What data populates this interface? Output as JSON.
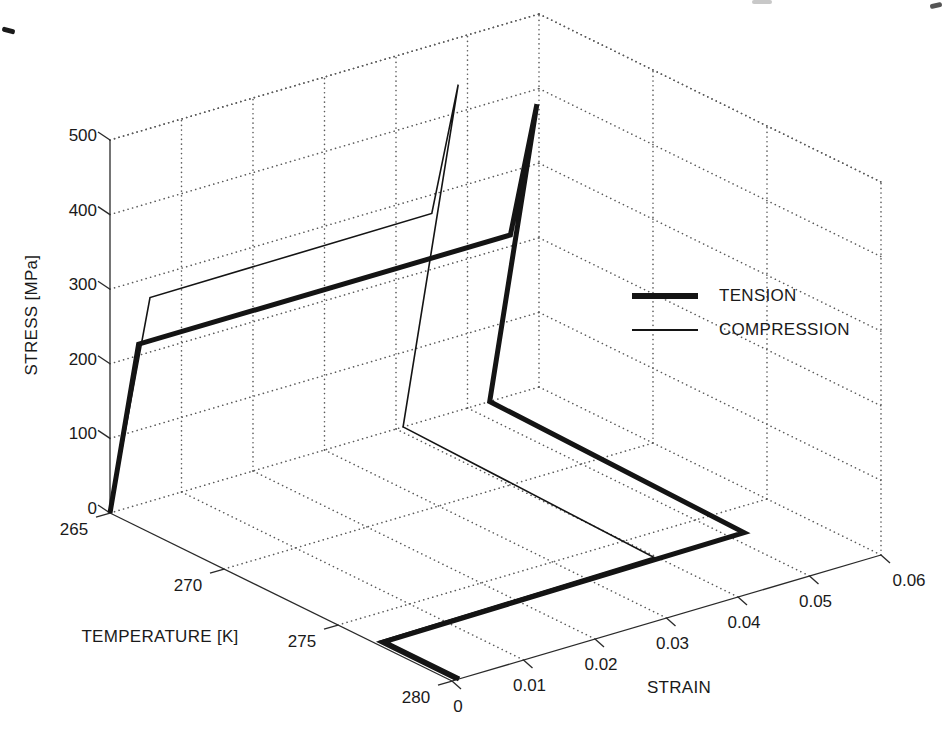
{
  "figure": {
    "background": "#ffffff",
    "curve_color": "#141414",
    "axis_color": "#2a2a2a",
    "grid_color": "#5a5a5a"
  },
  "legend": {
    "items": [
      {
        "label": "TENSION",
        "weight": "thick"
      },
      {
        "label": "COMPRESSION",
        "weight": "thin"
      }
    ]
  },
  "chart_data": {
    "type": "line",
    "view": "3d",
    "title": "",
    "xlabel": "STRAIN",
    "ylabel": "TEMPERATURE [K]",
    "zlabel": "STRESS [MPa]",
    "xlim": [
      0,
      0.06
    ],
    "ylim": [
      265,
      280
    ],
    "zlim": [
      0,
      500
    ],
    "grid": true,
    "xticks": [
      0,
      0.01,
      0.02,
      0.03,
      0.04,
      0.05,
      0.06
    ],
    "xtick_labels": [
      "0",
      "0.01",
      "0.02",
      "0.03",
      "0.04",
      "0.05",
      "0.06"
    ],
    "yticks": [
      265,
      270,
      275,
      280
    ],
    "ytick_labels": [
      "265",
      "270",
      "275",
      "280"
    ],
    "zticks": [
      0,
      100,
      200,
      300,
      400,
      500
    ],
    "ztick_labels": [
      "0",
      "100",
      "200",
      "300",
      "400",
      "500"
    ],
    "legend_position": "right",
    "series": [
      {
        "name": "TENSION",
        "style": "thick",
        "point_format": [
          "temperature_K",
          "strain",
          "stress_MPa"
        ],
        "points": [
          [
            265,
            0,
            0
          ],
          [
            265,
            0.004,
            215
          ],
          [
            265,
            0.056,
            215
          ],
          [
            265,
            0.0597,
            380
          ],
          [
            265,
            0.0531,
            0
          ],
          [
            276.5,
            0.052,
            0
          ],
          [
            276.7,
            0.001,
            0
          ],
          [
            280,
            0.001,
            0
          ]
        ]
      },
      {
        "name": "COMPRESSION",
        "style": "thin",
        "point_format": [
          "temperature_K",
          "strain",
          "stress_MPa"
        ],
        "points": [
          [
            265,
            0,
            0
          ],
          [
            265,
            0.0056,
            273
          ],
          [
            265,
            0.045,
            275
          ],
          [
            265,
            0.0487,
            437
          ],
          [
            265,
            0.041,
            0
          ],
          [
            276.4,
            0.0397,
            0
          ],
          [
            276.6,
            0.0005,
            0
          ],
          [
            280,
            0.0005,
            0
          ]
        ]
      }
    ]
  },
  "scan_artifacts": [
    {
      "x": 2,
      "y": 28,
      "w": 13,
      "h": 5,
      "color": "#1a1a1a",
      "rot": 15
    },
    {
      "x": 930,
      "y": 3,
      "w": 12,
      "h": 5,
      "color": "#555555",
      "rot": -12
    },
    {
      "x": 752,
      "y": 0,
      "w": 20,
      "h": 4,
      "color": "#c8c8c8",
      "rot": 0
    }
  ]
}
